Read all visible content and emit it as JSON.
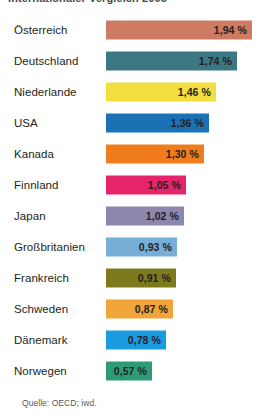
{
  "headline": "Internationaler Vergleich 2005",
  "source": "Quelle: OECD; iwd.",
  "chart_data": {
    "type": "bar",
    "orientation": "horizontal",
    "title": "Internationaler Vergleich 2005",
    "xlabel": "",
    "ylabel": "",
    "unit": "%",
    "value_suffix": " %",
    "decimal_separator": ",",
    "xlim": [
      0,
      2.0
    ],
    "grid": false,
    "legend": false,
    "categories": [
      "Österreich",
      "Deutschland",
      "Niederlande",
      "USA",
      "Kanada",
      "Finnland",
      "Japan",
      "Großbritanien",
      "Frankreich",
      "Schweden",
      "Dänemark",
      "Norwegen"
    ],
    "values": [
      1.94,
      1.74,
      1.46,
      1.36,
      1.3,
      1.05,
      1.02,
      0.93,
      0.91,
      0.87,
      0.78,
      0.57
    ],
    "value_labels": [
      "1,94 %",
      "1,74 %",
      "1,46 %",
      "1,36 %",
      "1,30 %",
      "1,05 %",
      "1,02 %",
      "0,93 %",
      "0,91 %",
      "0,87 %",
      "0,78 %",
      "0,57 %"
    ],
    "colors": [
      "#cd7b63",
      "#3c7883",
      "#f2de3f",
      "#1a72b5",
      "#f07d1c",
      "#e5246a",
      "#8d86ad",
      "#76aed8",
      "#7d7a1e",
      "#efa53a",
      "#1a9ae0",
      "#2e9b77"
    ],
    "bars": [
      {
        "category": "Österreich",
        "value": 1.94,
        "label": "1,94 %",
        "color": "#cd7b63",
        "width_px": 146
      },
      {
        "category": "Deutschland",
        "value": 1.74,
        "label": "1,74 %",
        "color": "#3c7883",
        "width_px": 131
      },
      {
        "category": "Niederlande",
        "value": 1.46,
        "label": "1,46 %",
        "color": "#f2de3f",
        "width_px": 110
      },
      {
        "category": "USA",
        "value": 1.36,
        "label": "1,36 %",
        "color": "#1a72b5",
        "width_px": 103
      },
      {
        "category": "Kanada",
        "value": 1.3,
        "label": "1,30 %",
        "color": "#f07d1c",
        "width_px": 98
      },
      {
        "category": "Finnland",
        "value": 1.05,
        "label": "1,05 %",
        "color": "#e5246a",
        "width_px": 80
      },
      {
        "category": "Japan",
        "value": 1.02,
        "label": "1,02 %",
        "color": "#8d86ad",
        "width_px": 78
      },
      {
        "category": "Großbritanien",
        "value": 0.93,
        "label": "0,93 %",
        "color": "#76aed8",
        "width_px": 71
      },
      {
        "category": "Frankreich",
        "value": 0.91,
        "label": "0,91 %",
        "color": "#7d7a1e",
        "width_px": 70
      },
      {
        "category": "Schweden",
        "value": 0.87,
        "label": "0,87 %",
        "color": "#efa53a",
        "width_px": 67
      },
      {
        "category": "Dänemark",
        "value": 0.78,
        "label": "0,78 %",
        "color": "#1a9ae0",
        "width_px": 60
      },
      {
        "category": "Norwegen",
        "value": 0.57,
        "label": "0,57 %",
        "color": "#2e9b77",
        "width_px": 46
      }
    ]
  }
}
